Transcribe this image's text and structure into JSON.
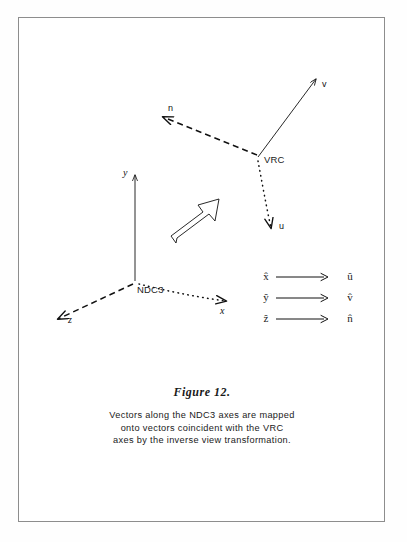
{
  "figure": {
    "title": "Figure 12.",
    "caption_lines": [
      "Vectors along the NDC3 axes are mapped",
      "onto vectors coincident with the VRC",
      "axes by the inverse view transformation."
    ],
    "border_color": "#8d8d8d",
    "ink_color": "#111111",
    "background": "#ffffff"
  },
  "vrc_triad": {
    "origin_label": "VRC",
    "axes": [
      {
        "name": "v",
        "label": "v",
        "style": "solid",
        "direction": "up-right"
      },
      {
        "name": "n",
        "label": "n",
        "style": "dashed",
        "direction": "up-left"
      },
      {
        "name": "u",
        "label": "u",
        "style": "dotted",
        "direction": "down-right"
      }
    ]
  },
  "ndc3_triad": {
    "origin_label": "NDC3",
    "axes": [
      {
        "name": "y",
        "label": "y",
        "style": "solid",
        "direction": "up"
      },
      {
        "name": "z",
        "label": "z",
        "style": "dashed",
        "direction": "down-left"
      },
      {
        "name": "x",
        "label": "x",
        "style": "dotted",
        "direction": "down-right"
      }
    ]
  },
  "transform_arrow": {
    "name": "block-arrow",
    "direction": "up-right",
    "filled": false
  },
  "mapping": {
    "rows": [
      {
        "from": "x̂",
        "arrow": "⟶",
        "to": "û"
      },
      {
        "from": "ŷ",
        "arrow": "⟶",
        "to": "v̂"
      },
      {
        "from": "ẑ",
        "arrow": "⟶",
        "to": "n̂"
      }
    ]
  }
}
